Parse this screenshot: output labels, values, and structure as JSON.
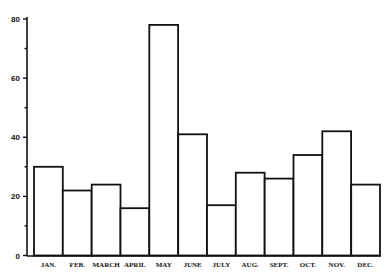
{
  "chart_data": {
    "type": "bar",
    "title": "",
    "xlabel": "",
    "ylabel": "",
    "categories": [
      "JAN.",
      "FEB.",
      "MARCH",
      "APRIL",
      "MAY",
      "JUNE",
      "JULY",
      "AUG.",
      "SEPT.",
      "OCT.",
      "NOV.",
      "DEC."
    ],
    "values": [
      30,
      22,
      24,
      16,
      78,
      41,
      17,
      28,
      26,
      34,
      42,
      24
    ],
    "ylim": [
      0,
      80
    ],
    "yticks_major": [
      0,
      20,
      40,
      60,
      80
    ],
    "yticks_minor": [
      10,
      30,
      50,
      70
    ],
    "ytick_labels": [
      "0",
      "20",
      "40",
      "60",
      "80"
    ],
    "grid": false,
    "legend": null,
    "bar_fill": "#ffffff",
    "bar_stroke": "#111111"
  }
}
